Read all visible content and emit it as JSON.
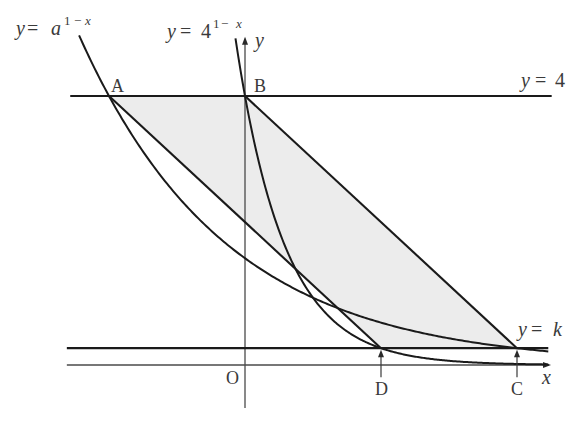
{
  "figure": {
    "curve_a_label": {
      "y": "y",
      "eq": "=",
      "base": "a",
      "exp_one": "1",
      "exp_minus": "−",
      "exp_x": "x"
    },
    "curve_4_label": {
      "y": "y",
      "eq": "=",
      "base": "4",
      "exp_one": "1",
      "exp_minus": "−",
      "exp_x": "x"
    },
    "line_4_label": {
      "y": "y",
      "eq": "=",
      "rhs": "4"
    },
    "line_k_label": {
      "y": "y",
      "eq": "=",
      "rhs": "k"
    },
    "axis_x_label": "x",
    "axis_y_label": "y",
    "origin_label": "O",
    "points": {
      "A": "A",
      "B": "B",
      "C": "C",
      "D": "D"
    }
  },
  "diagram_data": {
    "type": "function-graph",
    "curves": [
      {
        "id": "curve-a",
        "label": "y = a^(1-x)",
        "base": 1.5874,
        "x_range": [
          -2.44,
          4.46
        ]
      },
      {
        "id": "curve-4",
        "label": "y = 4^(1-x)",
        "base": 4,
        "x_range": [
          -0.14,
          4.46
        ]
      }
    ],
    "horizontal_lines": [
      {
        "id": "line-y4",
        "label": "y = 4",
        "y": 4,
        "x_range": [
          -2.57,
          4.51
        ]
      },
      {
        "id": "line-yk",
        "label": "y = k",
        "y": 0.25,
        "x_range": [
          -2.62,
          4.46
        ]
      }
    ],
    "points": {
      "A": [
        -2,
        4
      ],
      "B": [
        0,
        4
      ],
      "C": [
        4,
        0.25
      ],
      "D": [
        2,
        0.25
      ]
    },
    "shaded_region": [
      "A",
      "B",
      "C",
      "D"
    ],
    "segments": [
      [
        "A",
        "D"
      ],
      [
        "B",
        "C"
      ]
    ],
    "foot_arrows": [
      "C",
      "D"
    ],
    "axes": {
      "x_range": [
        -2.62,
        4.5
      ],
      "y_range": [
        -0.64,
        4.88
      ]
    },
    "colors": {
      "line": "#1a1a1a",
      "shade": "#ececec",
      "axis": "#4a4a4a",
      "text": "#3a3a3a"
    }
  }
}
